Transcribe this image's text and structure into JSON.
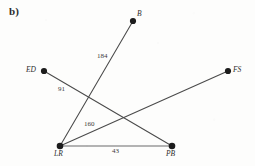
{
  "figure": {
    "panel_label": "b)",
    "background_color": "#fdfdfc",
    "edge_color": "#4a4a4a",
    "node_color": "#1c1c1c"
  },
  "graph": {
    "type": "weighted-graph",
    "nodes": [
      {
        "id": "B",
        "label": "B",
        "x": 133,
        "y": 21,
        "label_x": 137,
        "label_y": 10
      },
      {
        "id": "ED",
        "label": "ED",
        "x": 44,
        "y": 71,
        "label_x": 26,
        "label_y": 66
      },
      {
        "id": "FS",
        "label": "FS",
        "x": 228,
        "y": 71,
        "label_x": 233,
        "label_y": 66
      },
      {
        "id": "LR",
        "label": "LR",
        "x": 60,
        "y": 146,
        "label_x": 54,
        "label_y": 150
      },
      {
        "id": "PB",
        "label": "PB",
        "x": 172,
        "y": 146,
        "label_x": 166,
        "label_y": 150
      }
    ],
    "edges": [
      {
        "from": "LR",
        "to": "B",
        "weight": "184",
        "label_x": 97,
        "label_y": 53
      },
      {
        "from": "ED",
        "to": "PB",
        "weight": "91",
        "label_x": 58,
        "label_y": 86
      },
      {
        "from": "LR",
        "to": "FS",
        "weight": "160",
        "label_x": 84,
        "label_y": 121
      },
      {
        "from": "LR",
        "to": "PB",
        "weight": "43",
        "label_x": 112,
        "label_y": 148
      }
    ]
  }
}
